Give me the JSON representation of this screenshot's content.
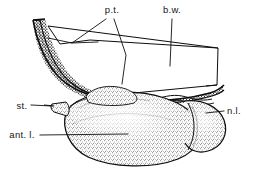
{
  "figure": {
    "background_color": "#ffffff",
    "ink_color": "#0d0d0d",
    "width": 253,
    "height": 172,
    "style": "stippled ink line drawing"
  },
  "labels": [
    {
      "id": "pt",
      "text": "p.t.",
      "meaning": "pars tuberalis",
      "x": 112,
      "y": 13,
      "anchor": "middle",
      "leaders": 2
    },
    {
      "id": "bw",
      "text": "b.w.",
      "meaning": "brain wall",
      "x": 172,
      "y": 13,
      "anchor": "middle",
      "leaders": 1
    },
    {
      "id": "st",
      "text": "st.",
      "meaning": "stalk",
      "x": 22,
      "y": 106,
      "anchor": "middle",
      "leaders": 1
    },
    {
      "id": "nl",
      "text": "n.l.",
      "meaning": "neural lobe",
      "x": 234,
      "y": 113,
      "anchor": "middle",
      "leaders": 1
    },
    {
      "id": "antl",
      "text": "ant. l.",
      "meaning": "anterior lobe",
      "x": 22,
      "y": 137,
      "anchor": "middle",
      "leaders": 1
    }
  ],
  "structures": [
    {
      "id": "pars-tuberalis-band",
      "name": "pars tuberalis band",
      "shading": "dense stipple with dark margin"
    },
    {
      "id": "brain-wall-outline",
      "name": "brain wall outline",
      "shading": "open quadrilateral, unshaded"
    },
    {
      "id": "anterior-lobe",
      "name": "anterior lobe",
      "shading": "medium stipple, rounded mass"
    },
    {
      "id": "neural-lobe",
      "name": "neural lobe",
      "shading": "medium stipple, small posterior lobe"
    },
    {
      "id": "stalk",
      "name": "stalk",
      "shading": "small pointed projection"
    }
  ]
}
